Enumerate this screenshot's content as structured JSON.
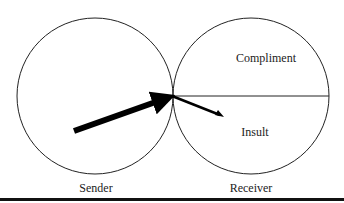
{
  "diagram": {
    "left_circle": {
      "label": "Sender"
    },
    "right_circle": {
      "label": "Receiver",
      "upper_half": "Compliment",
      "lower_half": "Insult"
    }
  }
}
